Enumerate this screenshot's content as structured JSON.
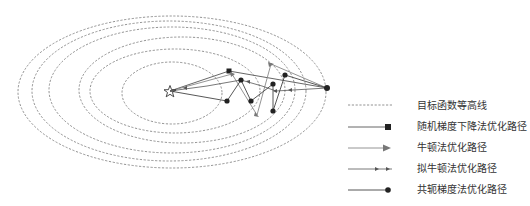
{
  "figure": {
    "type": "optimization-paths-on-contours",
    "contour_count": 6,
    "start_marker": "filled-circle",
    "optimum_marker": "star"
  },
  "legend": {
    "items": [
      {
        "id": "contour",
        "label": "目标函数等高线",
        "marker": "dashed-line"
      },
      {
        "id": "sgd",
        "label": "随机梯度下降法优化路径",
        "marker": "square"
      },
      {
        "id": "newton",
        "label": "牛顿法优化路径",
        "marker": "triangle-arrow"
      },
      {
        "id": "quasi_newton",
        "label": "拟牛顿法优化路径",
        "marker": "small-arrows"
      },
      {
        "id": "conjugate_gradient",
        "label": "共轭梯度法优化路径",
        "marker": "dot"
      }
    ]
  },
  "colors": {
    "contour": "#666666",
    "path_dark": "#444444",
    "path_gray": "#888888",
    "marker": "#222222",
    "text": "#333333"
  }
}
